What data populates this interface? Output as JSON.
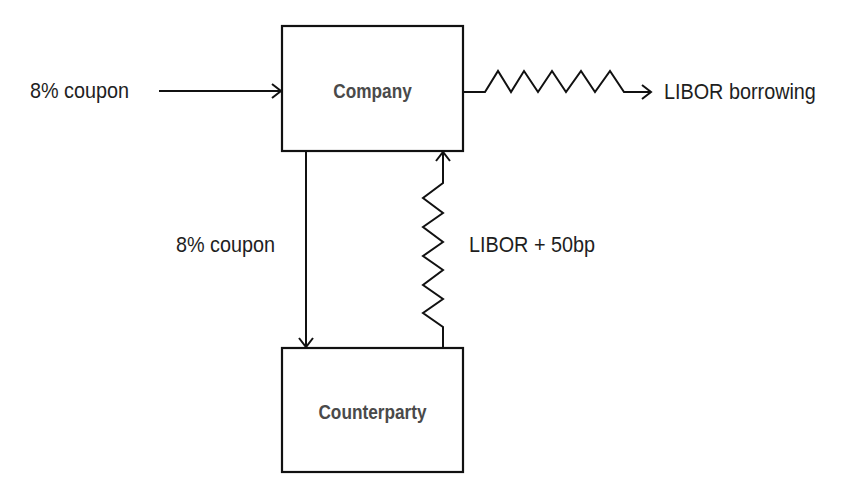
{
  "diagram": {
    "nodes": {
      "company": {
        "label": "Company"
      },
      "counterparty": {
        "label": "Counterparty"
      }
    },
    "flows": {
      "incoming_coupon": {
        "label": "8% coupon",
        "from": "external",
        "to": "company",
        "style": "straight"
      },
      "libor_borrowing": {
        "label": "LIBOR borrowing",
        "from": "company",
        "to": "external",
        "style": "zigzag"
      },
      "coupon_to_counterparty": {
        "label": "8% coupon",
        "from": "company",
        "to": "counterparty",
        "style": "straight"
      },
      "libor_plus_spread": {
        "label": "LIBOR + 50bp",
        "from": "counterparty",
        "to": "company",
        "style": "zigzag"
      }
    },
    "colors": {
      "line": "#111111",
      "text": "#1e1e1e",
      "box_text": "#4a4a4a",
      "background": "#ffffff"
    }
  }
}
